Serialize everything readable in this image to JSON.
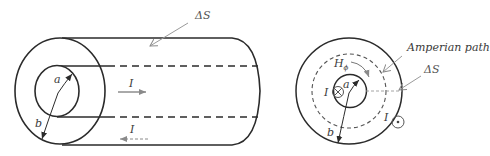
{
  "figure": {
    "colors": {
      "stroke": "#2b2b2b",
      "light_stroke": "#9a9a9a",
      "text": "#3a3a3a"
    },
    "left_view": {
      "title": "coax-3d-view",
      "labels": {
        "delta_s": "ΔS",
        "radius_inner": "a",
        "radius_outer": "b",
        "current_forward": "I",
        "current_return": "I"
      }
    },
    "right_view": {
      "title": "coax-cross-section",
      "labels": {
        "amperian_path": "Amperian path",
        "delta_s": "ΔS",
        "h_field": "H",
        "h_subscript": "ϕ",
        "radius_inner": "a",
        "radius_outer": "b",
        "current_inner": "I",
        "current_outer": "I",
        "into_page_symbol": "⊗",
        "out_of_page_symbol": "⊙"
      }
    }
  }
}
